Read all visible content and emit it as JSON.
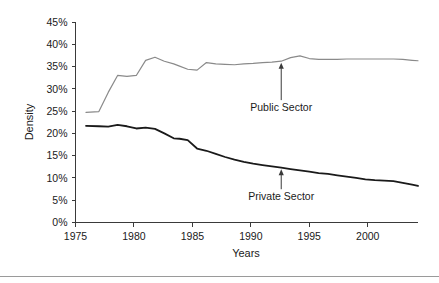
{
  "chart_data": {
    "type": "line",
    "title": "",
    "xlabel": "Years",
    "ylabel": "Density",
    "xlim": [
      1975,
      2004.3
    ],
    "ylim": [
      0,
      45
    ],
    "grid": false,
    "legend": "annotations",
    "xticks": [
      1975,
      1980,
      1985,
      1990,
      1995,
      2000
    ],
    "xtick_labels": [
      "1975",
      "1980",
      "1985",
      "1990",
      "1995",
      "2000"
    ],
    "yticks": [
      0,
      5,
      10,
      15,
      20,
      25,
      30,
      35,
      40,
      45
    ],
    "ytick_labels": [
      "0%",
      "5%",
      "10%",
      "15%",
      "20%",
      "25%",
      "30%",
      "35%",
      "40%",
      "45%"
    ],
    "x": [
      1975.9,
      1977.0,
      1977.8,
      1978.6,
      1979.4,
      1980.2,
      1981.0,
      1981.8,
      1982.6,
      1983.4,
      1983.9,
      1984.6,
      1985.4,
      1986.2,
      1987.0,
      1987.8,
      1988.6,
      1989.4,
      1990.2,
      1991.0,
      1991.8,
      1992.6,
      1993.4,
      1994.2,
      1995.0,
      1995.8,
      1996.6,
      1997.4,
      1998.2,
      1999.0,
      1999.8,
      2000.6,
      2001.4,
      2002.2,
      2003.0,
      2003.8,
      2004.3
    ],
    "series": [
      {
        "name": "Public Sector",
        "color": "#8a8a8a",
        "values": [
          24.7,
          24.9,
          29.2,
          33.0,
          32.8,
          33.0,
          36.4,
          37.1,
          36.2,
          35.6,
          35.1,
          34.4,
          34.2,
          35.9,
          35.6,
          35.5,
          35.4,
          35.6,
          35.7,
          35.9,
          36.0,
          36.2,
          37.0,
          37.4,
          36.8,
          36.6,
          36.6,
          36.6,
          36.7,
          36.7,
          36.7,
          36.7,
          36.7,
          36.7,
          36.6,
          36.4,
          36.3
        ]
      },
      {
        "name": "Private Sector",
        "color": "#1a1a1a",
        "values": [
          21.7,
          21.6,
          21.5,
          21.9,
          21.6,
          21.1,
          21.3,
          21.0,
          20.0,
          18.9,
          18.8,
          18.5,
          16.6,
          16.1,
          15.4,
          14.7,
          14.1,
          13.6,
          13.2,
          12.9,
          12.6,
          12.3,
          12.0,
          11.7,
          11.4,
          11.1,
          10.9,
          10.6,
          10.3,
          10.0,
          9.7,
          9.5,
          9.4,
          9.3,
          8.9,
          8.5,
          8.2
        ]
      }
    ],
    "annotations": [
      {
        "label": "Public Sector",
        "series": "Public Sector",
        "x": 1992.6,
        "y": 36.2,
        "label_x": 1992.6,
        "label_y": 25.0
      },
      {
        "label": "Private Sector",
        "series": "Private Sector",
        "x": 1992.6,
        "y": 12.3,
        "label_x": 1992.6,
        "label_y": 5.0
      }
    ]
  }
}
